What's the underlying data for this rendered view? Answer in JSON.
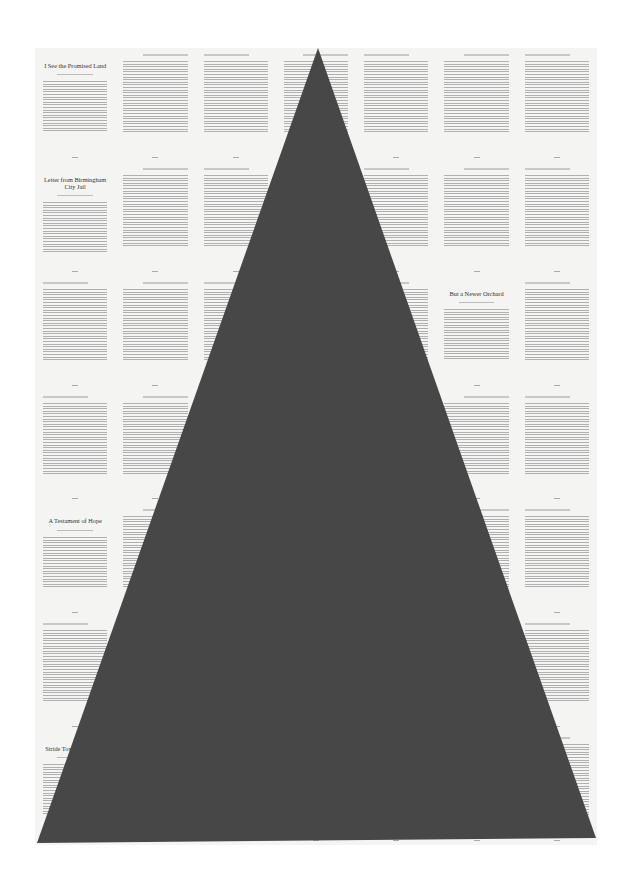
{
  "artwork": {
    "background": "#ffffff",
    "paper_color": "#f4f4f2",
    "triangle": {
      "fill": "#474747",
      "apex": [
        318,
        48
      ],
      "base_left": [
        37,
        843
      ],
      "base_right": [
        596,
        838
      ]
    },
    "grid": {
      "columns": 7,
      "rows": 7
    }
  },
  "chapter_titles": [
    {
      "row": 0,
      "col": 0,
      "text": "I See the Promised Land"
    },
    {
      "row": 1,
      "col": 0,
      "text": "Letter from Birmingham City Jail"
    },
    {
      "row": 2,
      "col": 5,
      "text": "But a Newer Orchard"
    },
    {
      "row": 4,
      "col": 0,
      "text": "A Testament of Hope"
    },
    {
      "row": 6,
      "col": 0,
      "text": "Stride Toward Freedom"
    }
  ]
}
